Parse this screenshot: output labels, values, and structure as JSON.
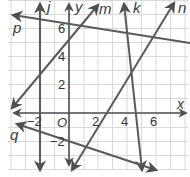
{
  "diagram": {
    "type": "coordinate-plane-lines",
    "axes": {
      "x_label": "x",
      "y_label": "y",
      "origin_label": "O",
      "x_ticks": [
        "−2",
        "2",
        "4",
        "6"
      ],
      "y_ticks": [
        "6",
        "4",
        "2",
        "−2"
      ]
    },
    "lines": [
      {
        "name": "j",
        "label": "j",
        "description": "vertical line x = -2"
      },
      {
        "name": "k",
        "label": "k",
        "description": "steep line crossing x-axis near 4.7"
      },
      {
        "name": "m",
        "label": "m",
        "description": "line with positive slope through (0,5.5)"
      },
      {
        "name": "n",
        "label": "n",
        "description": "line with positive slope through about (4,2)"
      },
      {
        "name": "p",
        "label": "p",
        "description": "line with negative slope through (0,6)"
      },
      {
        "name": "q",
        "label": "q",
        "description": "line with negative slope through about (0,-2)"
      }
    ],
    "colors": {
      "line": "#5a5a5a",
      "grid": "#d8d8d8",
      "axis": "#4a4a4a"
    }
  }
}
